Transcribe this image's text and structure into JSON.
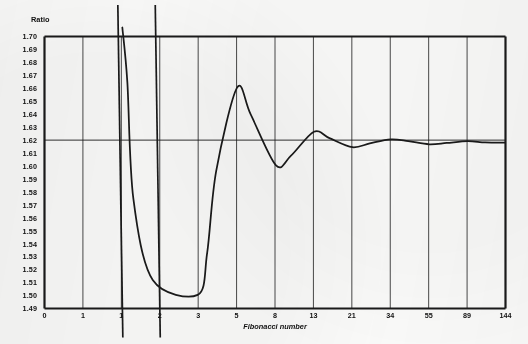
{
  "chart_data": {
    "type": "line",
    "title": "",
    "xlabel": "Fibonacci number",
    "ylabel": "Ratio",
    "categories": [
      "0",
      "1",
      "1",
      "2",
      "3",
      "5",
      "8",
      "13",
      "21",
      "34",
      "55",
      "89",
      "144"
    ],
    "xtick_labels": [
      "0",
      "1",
      "1",
      "2",
      "3",
      "5",
      "8",
      "13",
      "21",
      "34",
      "55",
      "89",
      "144"
    ],
    "ytick_labels": [
      "1.70",
      "1.69",
      "1.68",
      "1.67",
      "1.66",
      "1.65",
      "1.64",
      "1.63",
      "1.62",
      "1.61",
      "1.60",
      "1.59",
      "1.58",
      "1.57",
      "1.56",
      "1.55",
      "1.54",
      "1.53",
      "1.52",
      "1.51",
      "1.50",
      "1.49"
    ],
    "ylim": [
      1.49,
      1.7
    ],
    "grid": true,
    "legend_position": "none",
    "reference_line": {
      "value": 1.62,
      "label": ""
    },
    "series": [
      {
        "name": "Ratio of successive Fibonacci numbers",
        "x": [
          "0",
          "1",
          "1",
          "2",
          "3",
          "5",
          "8",
          "13",
          "21",
          "34",
          "55",
          "89",
          "144"
        ],
        "values": [
          null,
          null,
          2.0,
          1.5,
          1.667,
          1.6,
          1.625,
          1.6154,
          1.619,
          1.6176,
          1.6182,
          1.618,
          1.618
        ],
        "offscale_note": "values below 1.49 and above 1.70 run off the plotted range"
      }
    ],
    "asymptotes": [
      2,
      3
    ],
    "converges_to": 1.618
  },
  "axes": {
    "y_title": "Ratio",
    "x_title": "Fibonacci number"
  }
}
